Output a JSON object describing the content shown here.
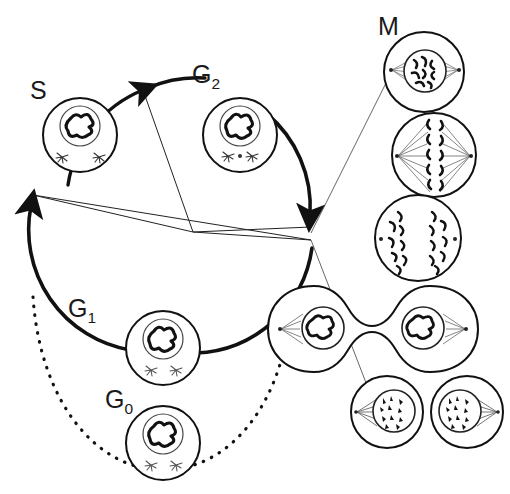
{
  "figure": {
    "type": "diagram",
    "background": "#ffffff",
    "ink": "#111111"
  },
  "labels": {
    "s_phase": "S",
    "g2_phase_main": "G",
    "g2_phase_sub": "2",
    "g1_phase_main": "G",
    "g1_phase_sub": "1",
    "g0_phase_main": "G",
    "g0_phase_sub": "0",
    "m_phase": "M"
  },
  "cycle": {
    "center_x": 193,
    "center_y": 232,
    "radius": 122,
    "arcs": [
      {
        "name": "s-to-g2-arc",
        "phase": "S to G2",
        "style": "solid-thick-arrow"
      },
      {
        "name": "g2-to-m-arc",
        "phase": "G2 to M",
        "style": "solid-thick-arrow"
      },
      {
        "name": "m-to-g1-arc",
        "phase": "M through G1 to S",
        "style": "solid-thick-arrow"
      },
      {
        "name": "g0-dotted-arc",
        "phase": "G1 exit to G0 and re-entry",
        "style": "dotted"
      }
    ],
    "sector_count": 4
  },
  "cells": {
    "s_phase": {
      "name": "s-phase-cell",
      "stage": "S phase",
      "cx": 80,
      "cy": 135,
      "r": 37,
      "nucleus_r": 20,
      "centrosomes": 2
    },
    "g2_phase": {
      "name": "g2-phase-cell",
      "stage": "G2 phase",
      "cx": 240,
      "cy": 135,
      "r": 37,
      "nucleus_r": 20,
      "centrosomes": 2
    },
    "g1_phase": {
      "name": "g1-phase-cell",
      "stage": "G1 phase",
      "cx": 163,
      "cy": 348,
      "r": 37,
      "nucleus_r": 20,
      "centrosomes": 2
    },
    "g0_phase": {
      "name": "g0-phase-cell",
      "stage": "G0 phase (quiescent)",
      "cx": 163,
      "cy": 443,
      "r": 37,
      "nucleus_r": 20,
      "centrosomes": 2
    }
  },
  "mitosis_panel": {
    "name": "m-phase-stage-column",
    "stages": [
      {
        "name": "prophase-cell",
        "stage": "Prophase",
        "cx": 424,
        "cy": 72,
        "r": 40
      },
      {
        "name": "metaphase-cell",
        "stage": "Metaphase",
        "cx": 434,
        "cy": 155,
        "r": 42
      },
      {
        "name": "anaphase-cell",
        "stage": "Anaphase",
        "cx": 418,
        "cy": 238,
        "r": 43
      },
      {
        "name": "telophase-cell",
        "stage": "Telophase / cytokinesis",
        "cx": 430,
        "cy": 329,
        "r": 44
      },
      {
        "name": "daughter-cell-left",
        "stage": "Daughter cell",
        "cx": 387,
        "cy": 412,
        "r": 36
      },
      {
        "name": "daughter-cell-right",
        "stage": "Daughter cell",
        "cx": 467,
        "cy": 412,
        "r": 36
      }
    ],
    "leader_lines": 2
  }
}
